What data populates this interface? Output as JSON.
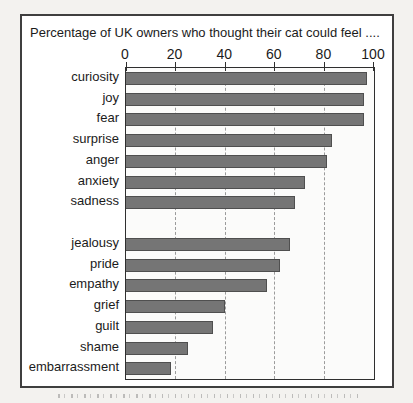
{
  "page": {
    "background": "#f3f2ef"
  },
  "chart": {
    "title": "Percentage of UK owners who thought their cat could feel ....",
    "frame_border_color": "#3f3f3f",
    "plot_background": "#fbfbfa",
    "bar_color": "#757575",
    "bar_border_color": "#4f4f4f",
    "gridline_color": "#9b9b9b",
    "text_color": "#1b1b1b"
  },
  "chart_data": {
    "type": "bar",
    "orientation": "horizontal",
    "title": "Percentage of UK owners who thought their cat could feel ....",
    "categories": [
      "curiosity",
      "joy",
      "fear",
      "surprise",
      "anger",
      "anxiety",
      "sadness",
      "jealousy",
      "pride",
      "empathy",
      "grief",
      "guilt",
      "shame",
      "embarrassment"
    ],
    "values": [
      97,
      96,
      96,
      83,
      81,
      72,
      68,
      66,
      62,
      57,
      40,
      35,
      25,
      18
    ],
    "x_ticks": [
      0,
      20,
      40,
      60,
      80,
      100
    ],
    "gridlines": [
      20,
      40,
      60,
      80
    ],
    "xlim": [
      0,
      100
    ],
    "axis_position": "top",
    "grid": "dashed-vertical",
    "legend": "none",
    "group_gap_after_index": 6,
    "xlabel": "",
    "ylabel": ""
  }
}
